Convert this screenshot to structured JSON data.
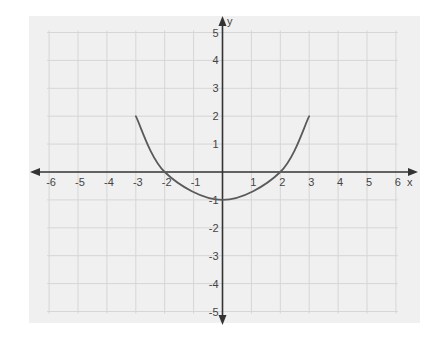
{
  "chart_data": {
    "type": "line",
    "title": "",
    "xlabel": "x",
    "ylabel": "y",
    "xlim": [
      -6,
      6
    ],
    "ylim": [
      -5,
      5
    ],
    "grid": true,
    "x_ticks": [
      -6,
      -5,
      -4,
      -3,
      -2,
      -1,
      1,
      2,
      3,
      4,
      5,
      6
    ],
    "y_ticks": [
      5,
      4,
      3,
      2,
      1,
      -1,
      -2,
      -3,
      -4,
      -5
    ],
    "x_tick_labels": [
      "-6",
      "-5",
      "-4",
      "-3",
      "-2",
      "-1",
      "1",
      "2",
      "3",
      "4",
      "5",
      "6"
    ],
    "y_tick_labels": [
      "5",
      "4",
      "3",
      "2",
      "1",
      "-1",
      "-2",
      "-3",
      "-4",
      "-5"
    ],
    "series": [
      {
        "name": "curve",
        "description": "U-shaped curve (parabola-like) from (-3,2) to (3,2), vertex at (0,-1), x-intercepts at -2 and 2",
        "points": [
          {
            "x": -3,
            "y": 2
          },
          {
            "x": -2,
            "y": 0
          },
          {
            "x": 0,
            "y": -1
          },
          {
            "x": 2,
            "y": 0
          },
          {
            "x": 3,
            "y": 2
          }
        ]
      }
    ],
    "legend": null
  },
  "colors": {
    "background": "#f0f0f0",
    "grid": "#d6d6d6",
    "axis": "#333333",
    "curve": "#5a5a5a",
    "text": "#444444"
  }
}
